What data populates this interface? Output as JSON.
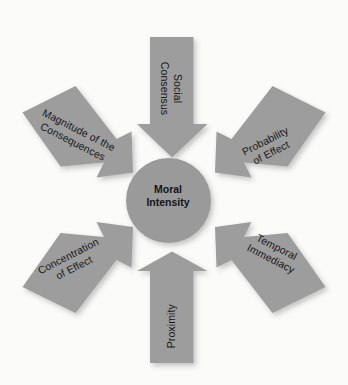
{
  "diagram": {
    "title": "Moral Intensity",
    "hub": {
      "label": "Moral\nIntensity",
      "color": "#9a9a9a",
      "text_color": "#141417"
    },
    "background_color": "#fbfbfa",
    "arrow_color": "#9d9d9d",
    "arrow_text_color": "#17171a",
    "arrows": [
      {
        "id": "social-consensus",
        "label": "Social\nConsensus",
        "position": "top",
        "direction": "down",
        "rotation_deg": 90
      },
      {
        "id": "probability-of-effect",
        "label": "Probability\nof Effect",
        "position": "top-right",
        "direction": "down-left",
        "rotation_deg": -27
      },
      {
        "id": "temporal-immediacy",
        "label": "Temporal\nImmediacy",
        "position": "bottom-right",
        "direction": "up-left",
        "rotation_deg": 27
      },
      {
        "id": "proximity",
        "label": "Proximity",
        "position": "bottom",
        "direction": "up",
        "rotation_deg": -90
      },
      {
        "id": "concentration-of-effect",
        "label": "Concentration\nof Effect",
        "position": "bottom-left",
        "direction": "up-right",
        "rotation_deg": -27
      },
      {
        "id": "magnitude-of-the-consequences",
        "label": "Magnitude of the\nConsequences",
        "position": "top-left",
        "direction": "down-right",
        "rotation_deg": 27
      }
    ]
  }
}
